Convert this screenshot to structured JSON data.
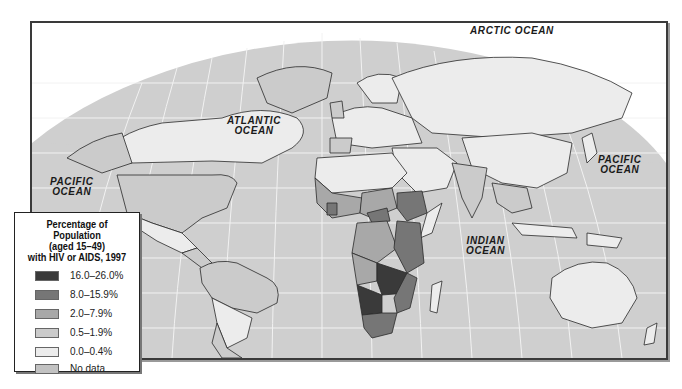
{
  "map": {
    "type": "choropleth world map",
    "ocean_labels": [
      {
        "id": "arctic",
        "line1": "ARCTIC OCEAN",
        "line2": ""
      },
      {
        "id": "atlantic",
        "line1": "ATLANTIC",
        "line2": "OCEAN"
      },
      {
        "id": "pacific_west",
        "line1": "PACIFIC",
        "line2": "OCEAN"
      },
      {
        "id": "pacific_east",
        "line1": "PACIFIC",
        "line2": "OCEAN"
      },
      {
        "id": "indian",
        "line1": "INDIAN",
        "line2": "OCEAN"
      }
    ],
    "colors": {
      "ocean": "#cfcfcf",
      "graticule": "#f2f2f2",
      "border": "#2a2a2a"
    }
  },
  "legend": {
    "title_line1": "Percentage of Population",
    "title_line2": "(aged 15–49)",
    "title_line3": "with HIV or AIDS, 1997",
    "items": [
      {
        "label": "16.0–26.0%",
        "color": "#3a3a3a"
      },
      {
        "label": "8.0–15.9%",
        "color": "#767676"
      },
      {
        "label": "2.0–7.9%",
        "color": "#a8a8a8"
      },
      {
        "label": "0.5–1.9%",
        "color": "#cbcbcb"
      },
      {
        "label": "0.0–0.4%",
        "color": "#ececec"
      },
      {
        "label": "No data",
        "color": "#c2c2c2"
      }
    ]
  }
}
